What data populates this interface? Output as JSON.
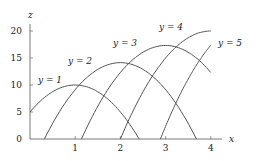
{
  "chart_data": {
    "type": "line",
    "title": "",
    "xlabel": "x",
    "ylabel": "z",
    "xlim": [
      0,
      4.2
    ],
    "ylim": [
      0,
      21
    ],
    "xticks": [
      1,
      2,
      3,
      4
    ],
    "yticks": [
      0,
      5,
      10,
      15,
      20
    ],
    "grid": false,
    "legend": "inline labels near curves",
    "series": [
      {
        "name": "y = 1",
        "x": [
          0,
          0.5,
          1,
          1.5,
          2,
          2.41
        ],
        "values": [
          5,
          8.75,
          10,
          8.75,
          5,
          0
        ]
      },
      {
        "name": "y = 2",
        "x": [
          0.32,
          1,
          1.5,
          2,
          2.5,
          3,
          3.68
        ],
        "values": [
          0,
          9.1,
          12.9,
          14.1,
          12.9,
          9.1,
          0
        ]
      },
      {
        "name": "y = 3",
        "x": [
          1.14,
          2,
          2.5,
          3,
          3.5,
          4
        ],
        "values": [
          0,
          12.3,
          16.1,
          17.3,
          16.1,
          12.3
        ]
      },
      {
        "name": "y = 4",
        "x": [
          2,
          2.5,
          3,
          3.5,
          4
        ],
        "values": [
          0,
          8.75,
          15,
          18.75,
          20
        ]
      },
      {
        "name": "y = 5",
        "x": [
          2.89,
          3.25,
          3.5,
          4
        ],
        "values": [
          0,
          7.7,
          11.7,
          17.4
        ]
      }
    ]
  },
  "labels": {
    "x_axis": "x",
    "z_axis": "z",
    "series": [
      "y = 1",
      "y = 2",
      "y = 3",
      "y = 4",
      "y = 5"
    ],
    "x_ticks": [
      "1",
      "2",
      "3",
      "4"
    ],
    "y_ticks": [
      "0",
      "5",
      "10",
      "15",
      "20"
    ]
  },
  "colors": {
    "curve": "#555555",
    "axis": "#555555",
    "background": "#ffffff"
  }
}
